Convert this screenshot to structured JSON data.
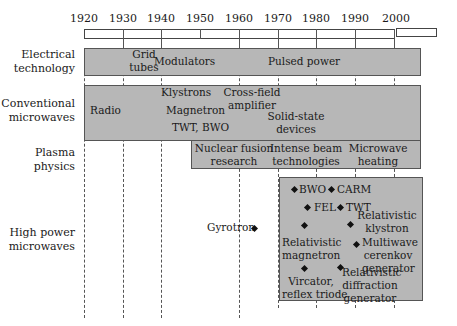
{
  "timeline": {
    "years": [
      "1920",
      "1930",
      "1940",
      "1950",
      "1960",
      "1970",
      "1980",
      "1990",
      "2000"
    ]
  },
  "rows": {
    "electrical": {
      "label_line1": "Electrical",
      "label_line2": "technology",
      "items": {
        "grid_1": "Grid",
        "grid_2": "tubes",
        "modulators": "Modulators",
        "pulsed": "Pulsed power"
      }
    },
    "conventional": {
      "label_line1": "Conventional",
      "label_line2": "microwaves",
      "items": {
        "radio": "Radio",
        "klystrons": "Klystrons",
        "magnetron": "Magnetron",
        "twt_bwo": "TWT, BWO",
        "cfa_1": "Cross-field",
        "cfa_2": "amplifier",
        "ss_1": "Solid-state",
        "ss_2": "devices"
      }
    },
    "plasma": {
      "label_line1": "Plasma",
      "label_line2": "physics",
      "items": {
        "nf_1": "Nuclear fusion",
        "nf_2": "research",
        "ib_1": "Intense beam",
        "ib_2": "technologies",
        "mh_1": "Microwave",
        "mh_2": "heating"
      }
    },
    "hpm": {
      "label_line1": "High power",
      "label_line2": "microwaves",
      "items": {
        "gyrotron": "Gyrotron",
        "bwo": "BWO",
        "carm": "CARM",
        "fel": "FEL",
        "twt": "TWT",
        "rk_1": "Relativistic",
        "rk_2": "klystron",
        "rm_1": "Relativistic",
        "rm_2": "magnetron",
        "mc_1": "Multiwave",
        "mc_2": "cerenkov",
        "mc_3": "generator",
        "vir_1": "Vircator,",
        "vir_2": "reflex triode",
        "rd_1": "Relativistic",
        "rd_2": "diffraction",
        "rd_3": "generator"
      }
    }
  }
}
